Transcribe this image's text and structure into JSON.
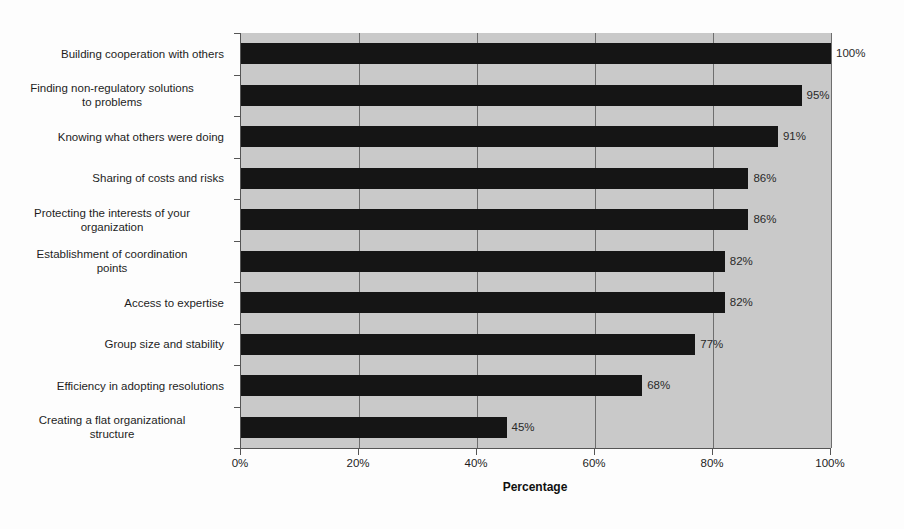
{
  "chart_data": {
    "type": "bar",
    "orientation": "horizontal",
    "title": "",
    "xlabel": "Percentage",
    "ylabel": "",
    "xlim": [
      0,
      100
    ],
    "xticks": [
      0,
      20,
      40,
      60,
      80,
      100
    ],
    "xtick_labels": [
      "0%",
      "20%",
      "40%",
      "60%",
      "80%",
      "100%"
    ],
    "grid": true,
    "legend": false,
    "categories": [
      "Building cooperation with others",
      "Finding non-regulatory solutions to problems",
      "Knowing what others were doing",
      "Sharing of costs and risks",
      "Protecting the interests of your organization",
      "Establishment of coordination points",
      "Access to expertise",
      "Group size and stability",
      "Efficiency in adopting resolutions",
      "Creating a flat organizational structure"
    ],
    "category_lines": [
      [
        "Building cooperation with others"
      ],
      [
        "Finding non-regulatory solutions",
        "to problems"
      ],
      [
        "Knowing what others were doing"
      ],
      [
        "Sharing of costs and risks"
      ],
      [
        "Protecting the interests of your",
        "organization"
      ],
      [
        "Establishment of coordination",
        "points"
      ],
      [
        "Access to expertise"
      ],
      [
        "Group size and stability"
      ],
      [
        "Efficiency in adopting resolutions"
      ],
      [
        "Creating a flat organizational",
        "structure"
      ]
    ],
    "values": [
      100,
      95,
      91,
      86,
      86,
      82,
      82,
      77,
      68,
      45
    ],
    "value_labels": [
      "100%",
      "95%",
      "91%",
      "86%",
      "86%",
      "82%",
      "82%",
      "77%",
      "68%",
      "45%"
    ],
    "colors": {
      "bar": "#151515",
      "plot_background": "#c9c9c9",
      "figure_background": "#fdfdfd",
      "axis": "#555555",
      "gridline": "#6e6e6e",
      "text": "#1d1d1d"
    }
  }
}
